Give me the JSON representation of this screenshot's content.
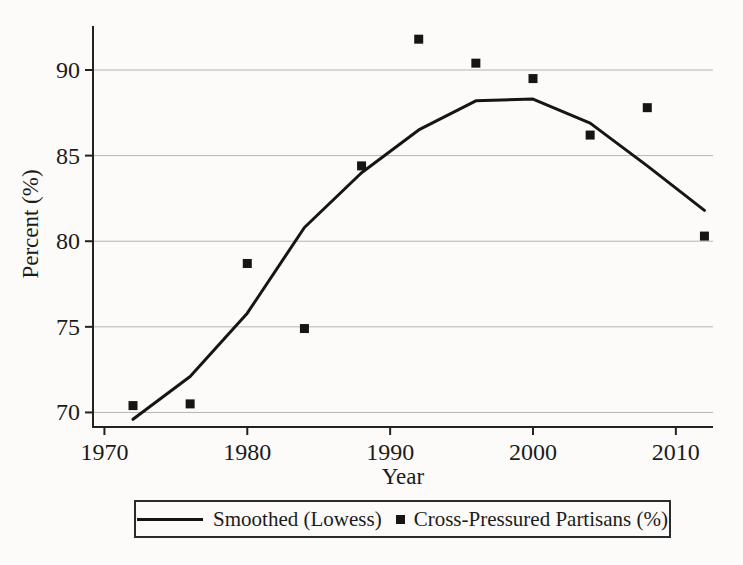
{
  "colors": {
    "line": "#151515",
    "marker": "#151515",
    "grid": "#b4b4b4",
    "axis": "#222222",
    "text": "#1b1b1b",
    "background": "#fcfbf9"
  },
  "chart_data": {
    "type": "line",
    "title": "",
    "xlabel": "Year",
    "ylabel": "Percent (%)",
    "xlim": [
      1969.2,
      2012.6
    ],
    "ylim": [
      69.15,
      92.57
    ],
    "x_ticks": [
      1970,
      1980,
      1990,
      2000,
      2010
    ],
    "y_ticks": [
      70,
      75,
      80,
      85,
      90
    ],
    "grid": "horizontal",
    "legend_position": "bottom",
    "x": [
      1972,
      1976,
      1980,
      1984,
      1988,
      1992,
      1996,
      2000,
      2004,
      2008,
      2012
    ],
    "series": [
      {
        "name": "Smoothed (Lowess)",
        "type": "line",
        "values": [
          69.6,
          72.1,
          75.8,
          80.8,
          84.0,
          86.5,
          88.2,
          88.3,
          86.9,
          84.4,
          81.8
        ]
      },
      {
        "name": "Cross-Pressured Partisans (%)",
        "type": "scatter",
        "marker": "square",
        "values": [
          70.4,
          70.5,
          78.7,
          74.9,
          84.4,
          91.8,
          90.4,
          89.5,
          86.2,
          87.8,
          80.3
        ]
      }
    ]
  }
}
